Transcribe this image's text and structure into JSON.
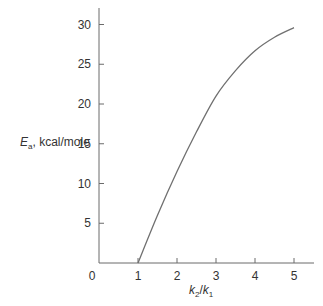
{
  "chart_data": {
    "type": "line",
    "title": "",
    "xlabel": "k2/k1",
    "ylabel": "Ea, kcal/mole",
    "xlim": [
      0,
      5.4
    ],
    "ylim": [
      0,
      32
    ],
    "x_ticks": [
      0,
      1,
      2,
      3,
      4,
      5
    ],
    "y_ticks": [
      0,
      5,
      10,
      15,
      20,
      25,
      30
    ],
    "grid": false,
    "legend": null,
    "series": [
      {
        "name": "Ea vs k2/k1",
        "x": [
          1,
          1.5,
          2,
          2.5,
          3,
          3.5,
          4,
          4.5,
          5
        ],
        "y": [
          0,
          6,
          11.5,
          16.5,
          21,
          24.2,
          26.7,
          28.4,
          29.6
        ]
      }
    ]
  },
  "labels": {
    "y_axis_main": "E",
    "y_axis_sub": "a",
    "y_axis_rest": ", kcal/mole",
    "x_axis_k2": "k",
    "x_axis_k2_sub": "2",
    "x_axis_sep": "/",
    "x_axis_k1": "k",
    "x_axis_k1_sub": "1"
  }
}
